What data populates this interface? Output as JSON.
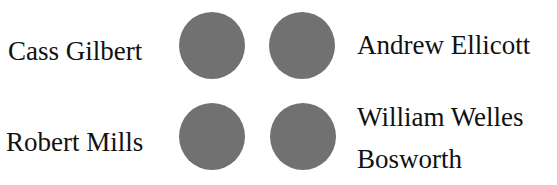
{
  "diagram": {
    "node_color": "#717171",
    "nodes": [
      {
        "label": "Cass Gilbert",
        "position": "top-left"
      },
      {
        "label": "Andrew Ellicott",
        "position": "top-right"
      },
      {
        "label": "Robert Mills",
        "position": "bottom-left"
      },
      {
        "label_line1": "William Welles",
        "label_line2": "Bosworth",
        "position": "bottom-right"
      }
    ]
  }
}
